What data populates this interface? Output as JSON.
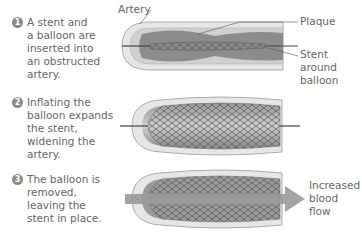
{
  "steps": [
    {
      "number": "1",
      "text": "A stent and\na balloon are\ninserted into\nan obstructed\nartery."
    },
    {
      "number": "2",
      "text": "Inflating the\nballoon expands\nthe stent,\nwidening the\nartery."
    },
    {
      "number": "3",
      "text": "The balloon is\nremoved,\nleaving the\nstent in place."
    }
  ],
  "labels": {
    "artery": "Artery",
    "plaque": "Plaque",
    "stent": "Stent\naround\nballoon",
    "flow": "Increased\nblood\nflow"
  },
  "colors": {
    "wall": "#e2e2e2",
    "wall_edge": "#9a9a9a",
    "plaque": "#8c8c8c",
    "stent": "#555555",
    "arrow": "#9a9a9a",
    "step_badge": "#8a8a8a"
  }
}
